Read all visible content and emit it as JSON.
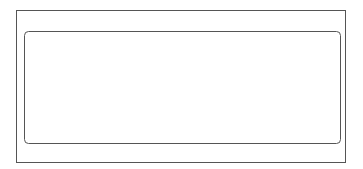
{
  "diagram": {
    "colors": {
      "stroke": "#555555",
      "segment_off": "#ffffff",
      "segment_on": "#dcdcdc",
      "text": "#333333"
    },
    "digits": [
      {
        "number": "1",
        "lit": []
      },
      {
        "number": "2",
        "lit": []
      },
      {
        "number": "3",
        "lit": []
      },
      {
        "number": "4",
        "lit": [
          "a",
          "b",
          "c"
        ]
      }
    ],
    "segment_labels": {
      "a": "a",
      "b": "b",
      "c": "c",
      "d": "d",
      "e": "e",
      "f": "f",
      "g": "g"
    },
    "decimal_points": [
      "1DP",
      "2DP",
      "3DP"
    ],
    "colon_label": "COL"
  }
}
